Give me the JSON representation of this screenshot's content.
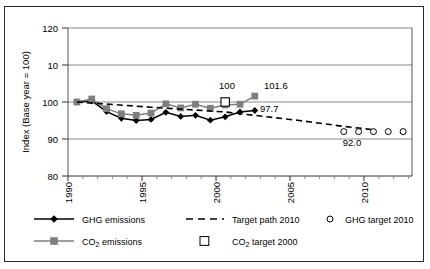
{
  "chart_data": {
    "type": "line",
    "title": "",
    "xlabel": "",
    "ylabel": "Index (Base year = 100)",
    "ylim": [
      80,
      120
    ],
    "xlim": [
      1989.4,
      2012.6
    ],
    "yticks": [
      80,
      90,
      100,
      110,
      120
    ],
    "ytick_labels": [
      "80",
      "90",
      "10",
      "120"
    ],
    "ytick_label_80": "80",
    "ytick_label_90": "90",
    "ytick_label_100": "100",
    "ytick_label_110": "10",
    "ytick_label_120": "120",
    "xticks": [
      1990,
      1995,
      2000,
      2005,
      2010
    ],
    "xtick_labels": [
      "1990",
      "1995",
      "2000",
      "2005",
      "2010"
    ],
    "grid": true,
    "legend_position": "bottom",
    "x": [
      1990,
      1991,
      1992,
      1993,
      1994,
      1995,
      1996,
      1997,
      1998,
      1999,
      2000,
      2001,
      2002
    ],
    "series": [
      {
        "name": "GHG emissions",
        "marker": "diamond",
        "color": "#000000",
        "values": [
          100.0,
          100.3,
          97.4,
          95.6,
          95.0,
          95.3,
          97.2,
          96.1,
          96.4,
          95.1,
          96.0,
          97.3,
          97.7
        ]
      },
      {
        "name": "CO2 emissions",
        "marker": "square",
        "color": "#7f7f7f",
        "values": [
          100.0,
          100.8,
          98.2,
          96.8,
          96.4,
          97.0,
          99.5,
          98.4,
          99.4,
          98.3,
          99.2,
          99.4,
          101.6
        ]
      },
      {
        "name": "Target path 2010",
        "marker": "none",
        "style": "dashed",
        "color": "#000000",
        "x": [
          1990,
          1995,
          2000,
          2005,
          2008,
          2010
        ],
        "values": [
          100.0,
          98.6,
          97.3,
          95.0,
          93.4,
          92.5
        ]
      },
      {
        "name": "GHG target 2010",
        "marker": "open-circle",
        "color": "#000000",
        "x": [
          2008,
          2009,
          2010,
          2011,
          2012
        ],
        "values": [
          92.0,
          92.0,
          92.0,
          92.0,
          92.0
        ]
      },
      {
        "name": "CO2 target 2000",
        "marker": "open-square",
        "color": "#000000",
        "x": [
          2000
        ],
        "values": [
          100.0
        ]
      }
    ],
    "annotations": [
      {
        "text": "100",
        "x": 2000,
        "y": 100,
        "series": "CO2 target 2000"
      },
      {
        "text": "101.6",
        "x": 2002,
        "y": 101.6,
        "series": "CO2 emissions"
      },
      {
        "text": "97.7",
        "x": 2002,
        "y": 97.7,
        "series": "GHG emissions"
      },
      {
        "text": "92.0",
        "x": 2010,
        "y": 92.0,
        "series": "GHG target 2010"
      }
    ]
  },
  "annotations": {
    "co2_target_value": "100",
    "co2_end_value": "101.6",
    "ghg_end_value": "97.7",
    "ghg_target_value": "92.0"
  },
  "axes": {
    "ytitle": "Index (Base year = 100)",
    "y_120": "120",
    "y_110": "10",
    "y_100": "100",
    "y_90": "90",
    "y_80": "80",
    "x_1990": "1990",
    "x_1995": "1995",
    "x_2000": "2000",
    "x_2005": "2005",
    "x_2010": "2010"
  },
  "legend": {
    "items": [
      {
        "label": "GHG emissions",
        "marker": "line-diamond",
        "color": "#000000"
      },
      {
        "label": "Target path 2010",
        "marker": "dashed-line",
        "color": "#000000"
      },
      {
        "label": "GHG target 2010",
        "marker": "open-circle",
        "color": "#000000"
      },
      {
        "label": "CO2 emissions",
        "marker": "line-square",
        "color": "#7f7f7f"
      },
      {
        "label": "CO2 target 2000",
        "marker": "open-square",
        "color": "#000000"
      }
    ],
    "ghg_emissions": "GHG emissions",
    "co2_emissions_pre": "CO",
    "co2_emissions_sub": "2",
    "co2_emissions_post": " emissions",
    "target_path": "Target path 2010",
    "co2_target_pre": "CO",
    "co2_target_sub": "2",
    "co2_target_post": " target 2000",
    "ghg_target": "GHG target 2010"
  },
  "colors": {
    "ghg": "#000000",
    "co2": "#7f7f7f",
    "grid": "#808080",
    "frame": "#2b2b2b"
  }
}
